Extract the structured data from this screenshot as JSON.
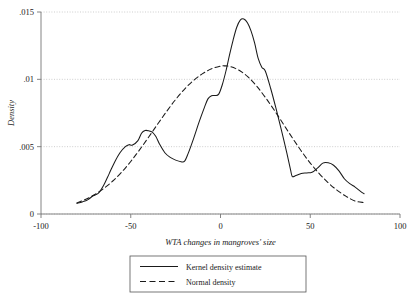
{
  "chart_data": {
    "type": "line",
    "title": "",
    "xlabel": "WTA changes in mangroves' size",
    "ylabel": "Density",
    "xlim": [
      -100,
      100
    ],
    "ylim": [
      0,
      0.015
    ],
    "grid": true,
    "xticks": [
      -100,
      -50,
      0,
      50,
      100
    ],
    "xtick_labels": [
      "-100",
      "-50",
      "0",
      "50",
      "100"
    ],
    "yticks": [
      0,
      0.005,
      0.01,
      0.015
    ],
    "ytick_labels": [
      "0",
      ".005",
      ".01",
      ".015"
    ],
    "legend_position": "below-center",
    "series": [
      {
        "name": "Kernel density estimate",
        "style": "solid",
        "color": "#1a1a1a",
        "x": [
          -80,
          -77,
          -74,
          -71,
          -68,
          -65,
          -62,
          -59,
          -56,
          -53,
          -51,
          -49,
          -46,
          -44,
          -42,
          -40,
          -38,
          -36,
          -34,
          -31,
          -28,
          -25,
          -22,
          -20,
          -18,
          -15,
          -12,
          -9,
          -7,
          -5,
          -3,
          -1,
          1,
          3,
          5,
          7,
          9,
          11,
          13,
          15,
          17,
          19,
          21,
          23,
          25,
          28,
          31,
          34,
          37,
          39,
          40,
          42,
          45,
          48,
          51,
          54,
          57,
          60,
          63,
          66,
          69,
          72,
          75,
          78,
          80
        ],
        "y": [
          0.0008,
          0.0009,
          0.00105,
          0.00135,
          0.00155,
          0.00215,
          0.003,
          0.00385,
          0.00455,
          0.005,
          0.00515,
          0.00512,
          0.00545,
          0.006,
          0.0062,
          0.00618,
          0.00608,
          0.00575,
          0.0052,
          0.00455,
          0.0042,
          0.004,
          0.00388,
          0.00392,
          0.0045,
          0.0056,
          0.0068,
          0.0079,
          0.00855,
          0.00878,
          0.0088,
          0.0089,
          0.0096,
          0.0106,
          0.0118,
          0.0129,
          0.01385,
          0.0144,
          0.01448,
          0.0142,
          0.0136,
          0.0127,
          0.01155,
          0.0109,
          0.0106,
          0.0093,
          0.0078,
          0.0062,
          0.0045,
          0.0033,
          0.00278,
          0.00285,
          0.003,
          0.00305,
          0.0031,
          0.0034,
          0.00378,
          0.0038,
          0.00362,
          0.0032,
          0.00262,
          0.00225,
          0.002,
          0.00168,
          0.0015
        ]
      },
      {
        "name": "Normal density",
        "style": "dashed",
        "color": "#1a1a1a",
        "x": [
          -80,
          -75,
          -70,
          -65,
          -60,
          -55,
          -50,
          -45,
          -40,
          -35,
          -30,
          -25,
          -20,
          -15,
          -10,
          -5,
          0,
          2,
          5,
          10,
          15,
          20,
          25,
          30,
          35,
          40,
          45,
          50,
          55,
          60,
          65,
          70,
          75,
          80
        ],
        "y": [
          0.00082,
          0.0011,
          0.00145,
          0.0019,
          0.00245,
          0.00312,
          0.0039,
          0.00478,
          0.00572,
          0.00668,
          0.00762,
          0.0085,
          0.00928,
          0.00992,
          0.01042,
          0.01078,
          0.01098,
          0.011,
          0.01096,
          0.0107,
          0.01022,
          0.00952,
          0.00866,
          0.0077,
          0.00668,
          0.00566,
          0.00468,
          0.00378,
          0.003,
          0.00232,
          0.00176,
          0.00131,
          0.00096,
          0.00085
        ]
      }
    ]
  },
  "legend": {
    "items": [
      {
        "label": "Kernel density estimate",
        "style": "solid"
      },
      {
        "label": "Normal density",
        "style": "dashed"
      }
    ]
  }
}
